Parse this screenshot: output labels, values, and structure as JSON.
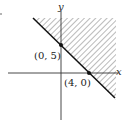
{
  "diagram": {
    "axes": {
      "x_label": "x",
      "y_label": "y"
    },
    "line": {
      "equation": "5x + 4y = 20"
    },
    "points": [
      {
        "label": "(0, 5)"
      },
      {
        "label": "(4, 0)"
      }
    ],
    "shaded_region": "above-right of line (hatched)",
    "colors": {
      "line": "#111111",
      "hatch": "#555555",
      "axis": "#333333"
    }
  }
}
